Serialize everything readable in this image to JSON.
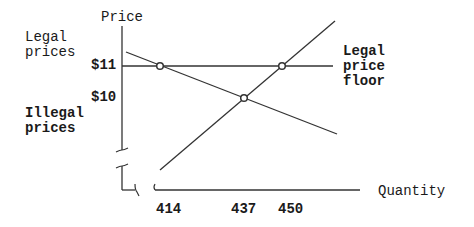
{
  "diagram": {
    "y_axis_label": "Price",
    "x_axis_label": "Quantity",
    "legal_prices_label": [
      "Legal",
      "prices"
    ],
    "illegal_prices_label": [
      "Illegal",
      "prices"
    ],
    "price_floor_label": [
      "Legal",
      "price",
      "floor"
    ],
    "price_ticks": [
      "$11",
      "$10"
    ],
    "quantity_ticks": [
      "414",
      "437",
      "450"
    ],
    "lines": [
      {
        "name": "demand",
        "from": [
          126,
          52
        ],
        "to": [
          337,
          134
        ]
      },
      {
        "name": "supply",
        "from": [
          160,
          170
        ],
        "to": [
          335,
          21
        ]
      },
      {
        "name": "price-floor",
        "from": [
          122,
          66
        ],
        "to": [
          333,
          66
        ]
      }
    ],
    "points": [
      {
        "name": "demand-at-floor",
        "quantity": "414",
        "price": "$11"
      },
      {
        "name": "equilibrium",
        "quantity": "437",
        "price": "$10"
      },
      {
        "name": "supply-at-floor",
        "quantity": "450",
        "price": "$11"
      }
    ],
    "line_color": "#333333"
  }
}
